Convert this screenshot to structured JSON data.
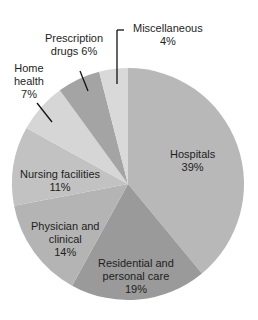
{
  "chart_data": {
    "type": "pie",
    "title": "",
    "categories": [
      "Hospitals",
      "Residential and personal care",
      "Physician and clinical",
      "Nursing facilities",
      "Home health",
      "Prescription drugs",
      "Miscellaneous"
    ],
    "values": [
      39,
      19,
      14,
      11,
      7,
      6,
      4
    ],
    "unit": "%",
    "start_angle_deg": 0,
    "direction": "clockwise",
    "colors": [
      "#b8b8b8",
      "#9a9a9a",
      "#b4b4b4",
      "#c2c2c2",
      "#d6d6d6",
      "#a4a4a4",
      "#d9d9d9"
    ],
    "legend": "none",
    "labels": [
      {
        "name": "Hospitals",
        "line1": "Hospitals",
        "line2": "39%",
        "line3": ""
      },
      {
        "name": "Residential and personal care",
        "line1": "Residential and",
        "line2": "personal care",
        "line3": "19%"
      },
      {
        "name": "Physician and clinical",
        "line1": "Physician and",
        "line2": "clinical",
        "line3": "14%"
      },
      {
        "name": "Nursing facilities",
        "line1": "Nursing facilities",
        "line2": "11%",
        "line3": ""
      },
      {
        "name": "Home health",
        "line1": "Home",
        "line2": "health",
        "line3": "7%"
      },
      {
        "name": "Prescription drugs",
        "line1": "Prescription",
        "line2": "drugs 6%",
        "line3": ""
      },
      {
        "name": "Miscellaneous",
        "line1": "Miscellaneous",
        "line2": "4%",
        "line3": ""
      }
    ]
  }
}
